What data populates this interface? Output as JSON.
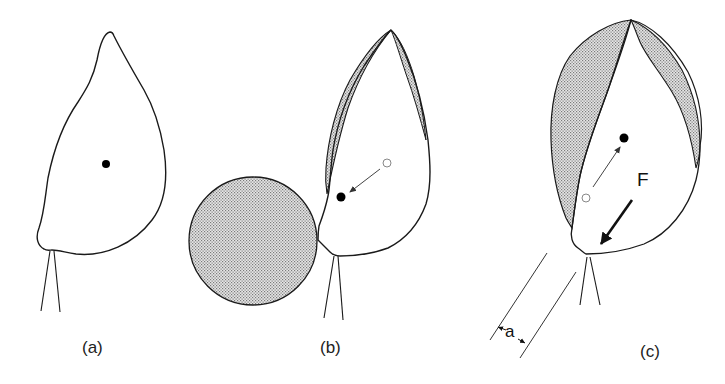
{
  "figure": {
    "panels": [
      {
        "id": "a",
        "label": "(a)",
        "description": "Seed on stalk, center of mass (filled dot) at rest"
      },
      {
        "id": "b",
        "label": "(b)",
        "description": "Seed pressed against a sphere; center of mass shifts from open circle to filled dot"
      },
      {
        "id": "c",
        "label": "(c)",
        "description": "Force F applied at attachment point; center of mass shifts, offset distance a"
      }
    ],
    "annotations": {
      "force": "F",
      "distance": "a"
    },
    "colors": {
      "stroke": "#1a1a1a",
      "shading": "#c8c8c8",
      "background": "#ffffff",
      "open_marker": "#888888"
    }
  }
}
